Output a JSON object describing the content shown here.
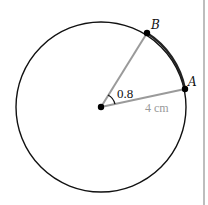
{
  "diagram": {
    "type": "circle-sector",
    "center": {
      "x": 101,
      "y": 107
    },
    "radius_px": 85,
    "points": {
      "A": {
        "label": "A",
        "x": 185,
        "y": 89
      },
      "B": {
        "label": "B",
        "x": 147,
        "y": 33
      }
    },
    "angle_label": "0.8",
    "radius_label": "4 cm",
    "colors": {
      "circle": "#111111",
      "radius_lines": "#9a9a9a",
      "arc_highlight": "#333333",
      "radius_label": "#999999"
    }
  }
}
